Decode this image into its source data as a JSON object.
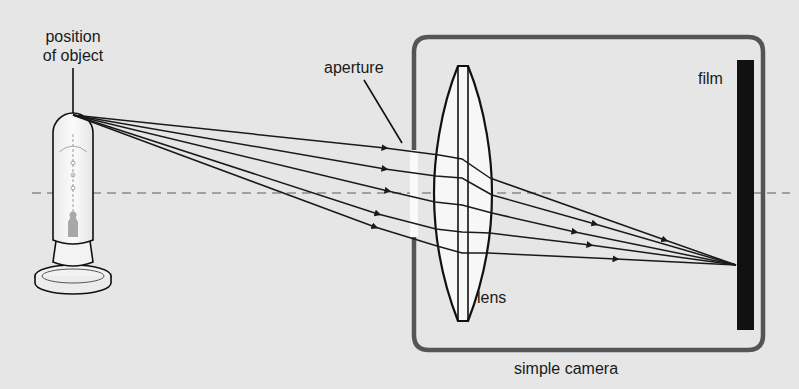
{
  "diagram": {
    "title": "simple camera",
    "labels": {
      "object_line1": "position",
      "object_line2": "of object",
      "aperture": "aperture",
      "lens": "lens",
      "film": "film",
      "camera": "simple camera"
    },
    "colors": {
      "background": "#e6e6e6",
      "camera_box": "#555555",
      "film": "#111111",
      "rays": "#1a1a1a",
      "optical_axis": "#8a8a8a",
      "lens_fill": "#f7f7f7"
    },
    "rays_count": 5,
    "components": [
      "light-bulb-object",
      "aperture",
      "convex-lens",
      "film",
      "camera-box",
      "optical-axis"
    ]
  }
}
